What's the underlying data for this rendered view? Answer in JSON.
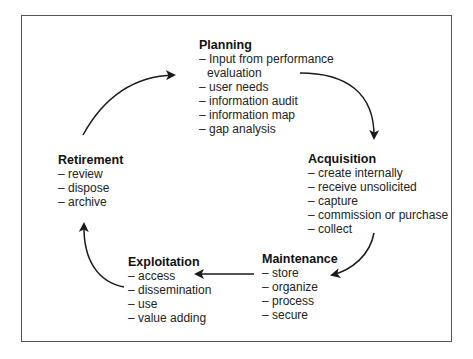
{
  "diagram": {
    "type": "cycle",
    "stages": [
      {
        "id": "planning",
        "title": "Planning",
        "items": [
          "– Input from performance",
          "evaluation",
          "– user needs",
          "– information audit",
          "– information map",
          "– gap analysis"
        ]
      },
      {
        "id": "acquisition",
        "title": "Acquisition",
        "items": [
          "– create internally",
          "– receive unsolicited",
          "– capture",
          "– commission or purchase",
          "– collect"
        ]
      },
      {
        "id": "maintenance",
        "title": "Maintenance",
        "items": [
          "– store",
          "– organize",
          "– process",
          "– secure"
        ]
      },
      {
        "id": "exploitation",
        "title": "Exploitation",
        "items": [
          "– access",
          "– dissemination",
          "– use",
          "– value adding"
        ]
      },
      {
        "id": "retirement",
        "title": "Retirement",
        "items": [
          "– review",
          "– dispose",
          "– archive"
        ]
      }
    ],
    "flow": [
      {
        "from": "planning",
        "to": "acquisition"
      },
      {
        "from": "acquisition",
        "to": "maintenance"
      },
      {
        "from": "maintenance",
        "to": "exploitation"
      },
      {
        "from": "exploitation",
        "to": "retirement"
      },
      {
        "from": "retirement",
        "to": "planning"
      }
    ],
    "colors": {
      "border": "#555555",
      "arrow": "#1a1a1a",
      "text": "#1a1a1a",
      "background": "#ffffff"
    }
  }
}
